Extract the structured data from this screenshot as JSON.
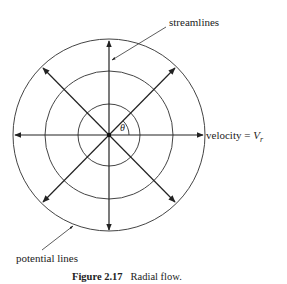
{
  "figure": {
    "caption_number": "Figure 2.17",
    "caption_text": "Radial flow.",
    "labels": {
      "streamlines": "streamlines",
      "potential_lines": "potential lines",
      "velocity_prefix": "velocity = ",
      "velocity_symbol": "V",
      "velocity_subscript": "r",
      "angle": "θ"
    },
    "geometry": {
      "center": [
        109,
        135
      ],
      "circle_radii": [
        31,
        64,
        96
      ],
      "streamline_directions_deg": [
        0,
        45,
        90,
        135,
        180,
        225,
        270,
        315
      ]
    },
    "colors": {
      "line": "#222222",
      "circle": "#444444",
      "background": "#ffffff"
    }
  }
}
